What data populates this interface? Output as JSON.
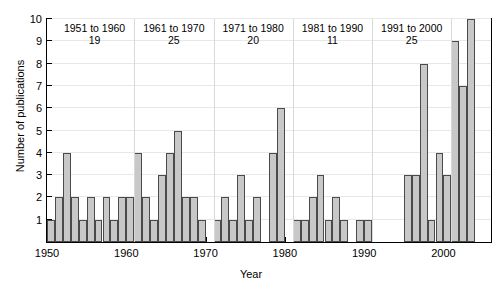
{
  "chart_data": {
    "type": "bar",
    "title": "",
    "xlabel": "Year",
    "ylabel": "Number of publications",
    "ylim": [
      0,
      10
    ],
    "xlim": [
      1950,
      2006
    ],
    "yticks": [
      0,
      1,
      2,
      3,
      4,
      5,
      6,
      7,
      8,
      9,
      10
    ],
    "ytick_labels": [
      "",
      "1",
      "2",
      "3",
      "4",
      "5",
      "6",
      "7",
      "8",
      "9",
      "10"
    ],
    "xticks": [
      1950,
      1960,
      1970,
      1980,
      1990,
      2000
    ],
    "xtick_labels": [
      "1950",
      "1960",
      "1970",
      "1980",
      "1990",
      "2000"
    ],
    "grid": true,
    "legend": "none",
    "bar_color": "#c8c8c8",
    "bar_edge_color": "#4a4a4a",
    "categories": [
      1950,
      1951,
      1952,
      1953,
      1954,
      1955,
      1956,
      1957,
      1958,
      1959,
      1960,
      1961,
      1962,
      1963,
      1964,
      1965,
      1966,
      1967,
      1968,
      1969,
      1970,
      1971,
      1972,
      1973,
      1974,
      1975,
      1976,
      1977,
      1978,
      1979,
      1980,
      1981,
      1982,
      1983,
      1984,
      1985,
      1986,
      1987,
      1988,
      1989,
      1990,
      1991,
      1992,
      1993,
      1994,
      1995,
      1996,
      1997,
      1998,
      1999,
      2000,
      2001,
      2002,
      2003,
      2004,
      2005
    ],
    "values": [
      1,
      2,
      4,
      2,
      1,
      2,
      1,
      2,
      1,
      2,
      2,
      4,
      2,
      1,
      3,
      4,
      5,
      2,
      2,
      1,
      0,
      1,
      2,
      1,
      3,
      1,
      2,
      0,
      4,
      6,
      0,
      1,
      1,
      2,
      3,
      1,
      2,
      1,
      0,
      1,
      1,
      0,
      0,
      0,
      0,
      3,
      3,
      8,
      1,
      4,
      3,
      9,
      7,
      10,
      0,
      0
    ]
  },
  "groups": [
    {
      "range": "1951 to 1960",
      "count": "19",
      "start_year": 1951,
      "end_year": 1960
    },
    {
      "range": "1961 to 1970",
      "count": "25",
      "start_year": 1961,
      "end_year": 1970
    },
    {
      "range": "1971 to 1980",
      "count": "20",
      "start_year": 1971,
      "end_year": 1980
    },
    {
      "range": "1981 to 1990",
      "count": "11",
      "start_year": 1981,
      "end_year": 1990
    },
    {
      "range": "1991 to 2000",
      "count": "25",
      "start_year": 1991,
      "end_year": 2000
    }
  ]
}
